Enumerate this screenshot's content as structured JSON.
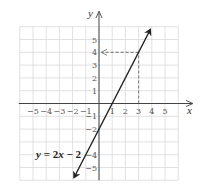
{
  "chart_data": {
    "type": "line",
    "title": "",
    "xlabel": "x",
    "ylabel": "y",
    "xlim": [
      -6,
      6
    ],
    "ylim": [
      -6,
      6
    ],
    "grid": true,
    "x_ticks": [
      -5,
      -4,
      -3,
      -2,
      -1,
      1,
      2,
      3,
      4,
      5
    ],
    "y_ticks": [
      5,
      4,
      3,
      2,
      1,
      -1,
      -2,
      -4,
      -5
    ],
    "x_tick_labels": [
      "−5",
      "−4",
      "−3",
      "−2",
      "−1",
      "1",
      "2",
      "3",
      "4",
      "5"
    ],
    "y_tick_labels": [
      "5",
      "4",
      "3",
      "2",
      "1",
      "−1",
      "−2",
      "−4",
      "−5"
    ],
    "series": [
      {
        "name": "y = 2x − 2",
        "equation": "y = 2x − 2",
        "slope": 2,
        "intercept": -2,
        "x": [
          -1.9,
          3.9
        ],
        "y": [
          -5.8,
          5.8
        ],
        "arrows_both_ends": true,
        "color": "#222222"
      }
    ],
    "annotations": [
      {
        "type": "dashed-guide",
        "description": "From x = 3 up to the line, then left to y = 4 with arrow at y-axis",
        "point": [
          3,
          4
        ],
        "color": "#888888"
      },
      {
        "type": "label",
        "text": "y = 2x − 2",
        "position": [
          -2.3,
          -3.9
        ]
      }
    ],
    "legend": null
  },
  "labels": {
    "x_axis": "x",
    "y_axis": "y",
    "equation": {
      "y": "y",
      "eq": " = 2",
      "x": "x",
      "rest": " − 2"
    }
  }
}
